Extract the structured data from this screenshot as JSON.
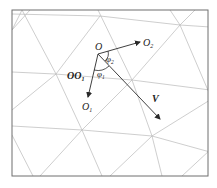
{
  "diagram": {
    "labels": {
      "origin": "O",
      "o2": "O",
      "o2_sub": "2",
      "o1": "O",
      "o1_sub": "1",
      "oo1": "OO",
      "oo1_sub": "1",
      "phi2": "φ",
      "phi2_sub": "2",
      "phi1": "φ",
      "phi1_sub": "1",
      "v": "V"
    },
    "colors": {
      "frame": "#6f6f6f",
      "grid": "#b9b9b9",
      "vector": "#2a2a2a"
    }
  }
}
